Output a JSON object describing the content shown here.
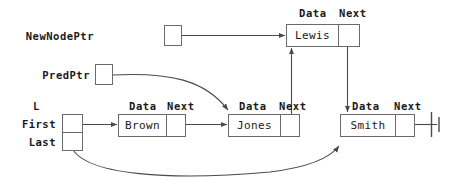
{
  "diagram": {
    "field_labels": {
      "data": "Data",
      "next": "Next"
    },
    "colors": {
      "line": "#6b6b6b",
      "text": "#1a1a1a",
      "background": "#ffffff"
    }
  },
  "pointers": [
    {
      "id": "newnodeptr",
      "label": "NewNodePtr",
      "target": "Lewis"
    },
    {
      "id": "predptr",
      "label": "PredPtr",
      "target": "Jones"
    }
  ],
  "list_header": {
    "name": "L",
    "fields": [
      {
        "id": "first",
        "label": "First",
        "target": "Brown"
      },
      {
        "id": "last",
        "label": "Last",
        "target": "Smith"
      }
    ]
  },
  "nodes": [
    {
      "id": "lewis",
      "data": "Lewis",
      "data_label": "Data",
      "next_label": "Next",
      "next_target": "Smith"
    },
    {
      "id": "brown",
      "data": "Brown",
      "data_label": "Data",
      "next_label": "Next",
      "next_target": "Jones"
    },
    {
      "id": "jones",
      "data": "Jones",
      "data_label": "Data",
      "next_label": "Next",
      "next_target": "Lewis"
    },
    {
      "id": "smith",
      "data": "Smith",
      "data_label": "Data",
      "next_label": "Next",
      "next_target": "null"
    }
  ]
}
